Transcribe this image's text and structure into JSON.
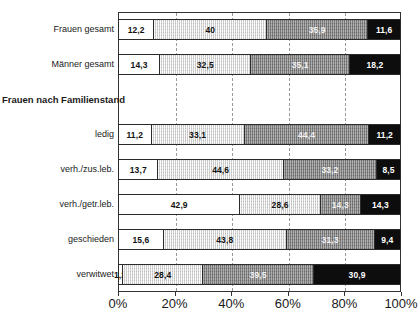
{
  "chart_data": {
    "type": "bar",
    "orientation": "horizontal",
    "stacked": true,
    "stacked_percent": true,
    "title": "",
    "subtitle": "",
    "xlabel": "",
    "ylabel": "",
    "xlim": [
      0,
      100
    ],
    "grid": true,
    "grid_axis": "x",
    "legend_position": "none",
    "xticks": [
      0,
      20,
      40,
      60,
      80,
      100
    ],
    "xtick_labels": [
      "0%",
      "20%",
      "40%",
      "60%",
      "80%",
      "100%"
    ],
    "categories": [
      "Frauen gesamt",
      "Männer gesamt",
      "Frauen nach Familienstand",
      "ledig",
      "verh./zus.leb.",
      "verh./getr.leb.",
      "geschieden",
      "verwitwet"
    ],
    "series": [
      {
        "name": "Segment 1",
        "color": "#ffffff",
        "values": [
          12.2,
          14.3,
          null,
          11.2,
          13.7,
          42.9,
          15.6,
          1.2
        ]
      },
      {
        "name": "Segment 2",
        "color": "#dcdcdc",
        "values": [
          40,
          32.5,
          null,
          33.1,
          44.6,
          28.6,
          43.8,
          28.4
        ]
      },
      {
        "name": "Segment 3",
        "color": "#8e8e8e",
        "values": [
          35.9,
          35.1,
          null,
          44.4,
          33.2,
          14.3,
          31.3,
          39.5
        ]
      },
      {
        "name": "Segment 4",
        "color": "#0d0d0d",
        "values": [
          11.6,
          18.2,
          null,
          11.2,
          8.5,
          14.3,
          9.4,
          30.9
        ]
      }
    ],
    "rows": [
      {
        "label": "Frauen gesamt",
        "is_header": false,
        "has_bar": true,
        "segments": [
          {
            "value": 12.2,
            "label": "12,2",
            "style": "s0"
          },
          {
            "value": 40,
            "label": "40",
            "style": "s1"
          },
          {
            "value": 35.9,
            "label": "35,9",
            "style": "s2"
          },
          {
            "value": 11.6,
            "label": "11,6",
            "style": "s3"
          }
        ]
      },
      {
        "label": "Männer gesamt",
        "is_header": false,
        "has_bar": true,
        "segments": [
          {
            "value": 14.3,
            "label": "14,3",
            "style": "s0"
          },
          {
            "value": 32.5,
            "label": "32,5",
            "style": "s1"
          },
          {
            "value": 35.1,
            "label": "35,1",
            "style": "s2"
          },
          {
            "value": 18.2,
            "label": "18,2",
            "style": "s3"
          }
        ]
      },
      {
        "label": "Frauen nach Familienstand",
        "is_header": true,
        "has_bar": false,
        "segments": []
      },
      {
        "label": "ledig",
        "is_header": false,
        "has_bar": true,
        "segments": [
          {
            "value": 11.2,
            "label": "11,2",
            "style": "s0"
          },
          {
            "value": 33.1,
            "label": "33,1",
            "style": "s1"
          },
          {
            "value": 44.4,
            "label": "44,4",
            "style": "s2"
          },
          {
            "value": 11.2,
            "label": "11,2",
            "style": "s3"
          }
        ]
      },
      {
        "label": "verh./zus.leb.",
        "is_header": false,
        "has_bar": true,
        "segments": [
          {
            "value": 13.7,
            "label": "13,7",
            "style": "s0"
          },
          {
            "value": 44.6,
            "label": "44,6",
            "style": "s1"
          },
          {
            "value": 33.2,
            "label": "33,2",
            "style": "s2"
          },
          {
            "value": 8.5,
            "label": "8,5",
            "style": "s3"
          }
        ]
      },
      {
        "label": "verh./getr.leb.",
        "is_header": false,
        "has_bar": true,
        "segments": [
          {
            "value": 42.9,
            "label": "42,9",
            "style": "s0"
          },
          {
            "value": 28.6,
            "label": "28,6",
            "style": "s1"
          },
          {
            "value": 14.3,
            "label": "14,3",
            "style": "s2"
          },
          {
            "value": 14.3,
            "label": "14,3",
            "style": "s3"
          }
        ]
      },
      {
        "label": "geschieden",
        "is_header": false,
        "has_bar": true,
        "segments": [
          {
            "value": 15.6,
            "label": "15,6",
            "style": "s0"
          },
          {
            "value": 43.8,
            "label": "43,8",
            "style": "s1"
          },
          {
            "value": 31.3,
            "label": "31,3",
            "style": "s2"
          },
          {
            "value": 9.4,
            "label": "9,4",
            "style": "s3"
          }
        ]
      },
      {
        "label": "verwitwet",
        "is_header": false,
        "has_bar": true,
        "segments": [
          {
            "value": 1.2,
            "label": "1,2",
            "style": "s0",
            "overflow_left": true
          },
          {
            "value": 28.4,
            "label": "28,4",
            "style": "s1"
          },
          {
            "value": 39.5,
            "label": "39,5",
            "style": "s2"
          },
          {
            "value": 30.9,
            "label": "30,9",
            "style": "s3"
          }
        ]
      }
    ]
  }
}
